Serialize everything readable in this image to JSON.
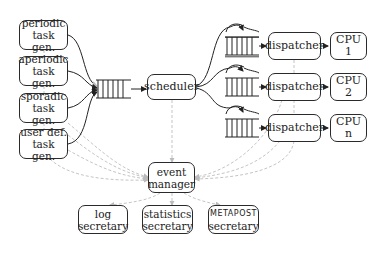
{
  "diagram": {
    "generators": [
      {
        "line1": "periodic",
        "line2": "task gen."
      },
      {
        "line1": "aperiodic",
        "line2": "task gen."
      },
      {
        "line1": "sporadic",
        "line2": "task gen."
      },
      {
        "line1": "user def.",
        "line2": "task gen."
      }
    ],
    "scheduler": {
      "label": "scheduler"
    },
    "dispatchers": [
      {
        "label": "dispatcher",
        "cpu": "CPU 1"
      },
      {
        "label": "dispatcher",
        "cpu": "CPU 2"
      },
      {
        "label": "dispatcher",
        "cpu": "CPU n"
      }
    ],
    "event_manager": {
      "line1": "event",
      "line2": "manager"
    },
    "secretaries": [
      {
        "line1": "log",
        "line2": "secretary"
      },
      {
        "line1": "statistics",
        "line2": "secretary"
      },
      {
        "line1": "METAPOST",
        "line2": "secretary"
      }
    ],
    "colors": {
      "stroke": "#2a2a2a",
      "event_wire": "#b8b8b8",
      "background": "#ffffff"
    }
  }
}
